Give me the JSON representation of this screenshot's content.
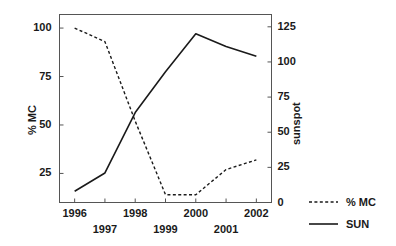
{
  "chart_data": {
    "type": "line",
    "title": "",
    "xlabel": "",
    "ylabel": "% MC",
    "y2label": "sunspot",
    "x": [
      1996,
      1997,
      1998,
      1999,
      2000,
      2001,
      2002
    ],
    "xticklabels": [
      "1996",
      "1997",
      "1998",
      "1999",
      "2000",
      "2001",
      "2002"
    ],
    "xlim": [
      1995.5,
      2002.5
    ],
    "ylim": [
      10,
      107
    ],
    "yticks": [
      25,
      50,
      75,
      100
    ],
    "yticklabels": [
      "25",
      "50",
      "75",
      "100"
    ],
    "y2lim": [
      0,
      133.75
    ],
    "y2ticks": [
      0,
      25,
      50,
      75,
      100,
      125
    ],
    "y2ticklabels": [
      "0",
      "25",
      "50",
      "75",
      "100",
      "125"
    ],
    "grid": false,
    "legend_position": "right",
    "series": [
      {
        "name": "% MC",
        "axis": "left",
        "style": "dashed",
        "color": "#1a1a1a",
        "values": [
          100,
          93,
          52,
          14,
          14,
          27,
          32
        ]
      },
      {
        "name": "SUN",
        "axis": "right",
        "style": "solid",
        "color": "#1a1a1a",
        "values": [
          8,
          21,
          64,
          93,
          120,
          111,
          104
        ]
      }
    ]
  },
  "legend": {
    "entries": [
      {
        "label": "% MC",
        "style": "dashed"
      },
      {
        "label": "SUN",
        "style": "solid"
      }
    ]
  }
}
